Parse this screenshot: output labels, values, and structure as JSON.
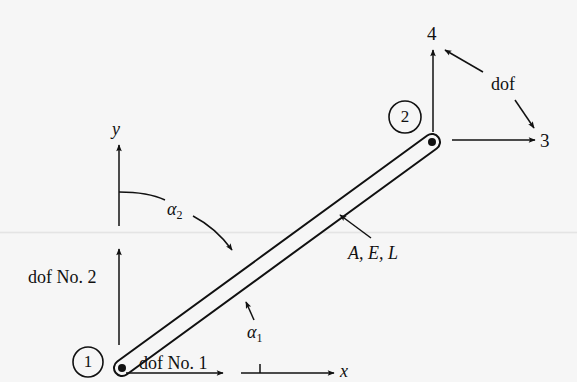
{
  "figure": {
    "type": "truss-bar-element",
    "colors": {
      "background": "#f6f6f6",
      "ink": "#111111"
    }
  },
  "nodes": [
    {
      "id": 1,
      "label": "1"
    },
    {
      "id": 2,
      "label": "2"
    }
  ],
  "element": {
    "properties_label": "A, E, L"
  },
  "axes": {
    "x_label": "x",
    "y_label": "y"
  },
  "angles": {
    "alpha1": {
      "symbol": "α",
      "subscript": "1"
    },
    "alpha2": {
      "symbol": "α",
      "subscript": "2"
    }
  },
  "dofs": {
    "dof1_label": "dof No. 1",
    "dof2_label": "dof No. 2",
    "dof3_label": "3",
    "dof4_label": "4",
    "dof_group_label": "dof"
  }
}
